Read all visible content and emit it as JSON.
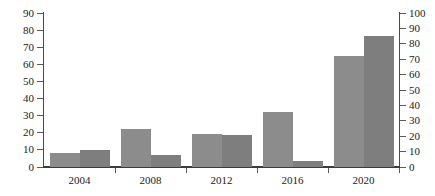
{
  "chart_data": {
    "type": "bar",
    "title": "",
    "xlabel": "",
    "ylabel": "",
    "grid": false,
    "legend": "none",
    "categories": [
      "2004",
      "2008",
      "2012",
      "2016",
      "2020"
    ],
    "series": [
      {
        "name": "series-left",
        "axis": "left",
        "color": "#8c8c8c",
        "values": [
          8,
          22,
          19,
          32,
          65
        ]
      },
      {
        "name": "series-right",
        "axis": "right",
        "color": "#7e7e7e",
        "values": [
          11,
          8,
          21,
          4,
          85
        ]
      }
    ],
    "axes": {
      "left": {
        "min": 0,
        "max": 90,
        "step": 10,
        "ticks": [
          "0",
          "10",
          "20",
          "30",
          "40",
          "50",
          "60",
          "70",
          "80",
          "90"
        ]
      },
      "right": {
        "min": 0,
        "max": 100,
        "step": 10,
        "ticks": [
          "0",
          "10",
          "20",
          "30",
          "40",
          "50",
          "60",
          "70",
          "80",
          "90",
          "100"
        ]
      }
    }
  },
  "colors": {
    "bar_left": "#8c8c8c",
    "bar_right": "#7e7e7e",
    "axis": "#4a4a4a",
    "baseline": "#3b3b3b",
    "text": "#1a1a1a",
    "background": "#ffffff"
  }
}
